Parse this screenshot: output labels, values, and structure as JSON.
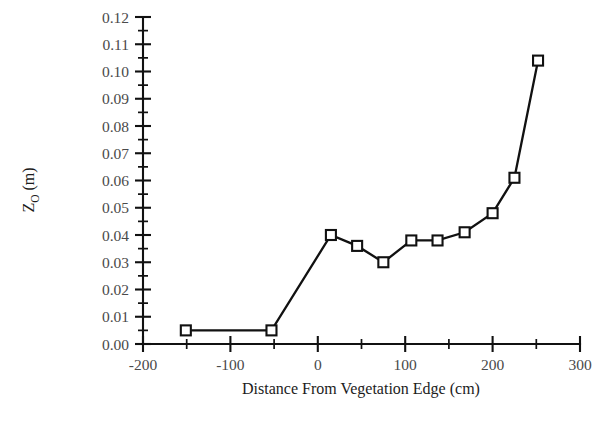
{
  "chart_data": {
    "type": "line",
    "title": "",
    "xlabel": "Distance From Vegetation Edge (cm)",
    "ylabel": "Z_O (m)",
    "ylabel_base": "Z",
    "ylabel_sub": "O",
    "ylabel_unit": " (m)",
    "xlim": [
      -200,
      300
    ],
    "ylim": [
      0.0,
      0.12
    ],
    "x_major_ticks": [
      -200,
      -100,
      0,
      100,
      200,
      300
    ],
    "x_major_tick_labels": [
      "-200",
      "-100",
      "0",
      "100",
      "200",
      "300"
    ],
    "x_minor_tick_interval": 50,
    "y_major_ticks": [
      0.0,
      0.01,
      0.02,
      0.03,
      0.04,
      0.05,
      0.06,
      0.07,
      0.08,
      0.09,
      0.1,
      0.11,
      0.12
    ],
    "y_major_tick_labels": [
      "0.00",
      "0.01",
      "0.02",
      "0.03",
      "0.04",
      "0.05",
      "0.06",
      "0.07",
      "0.08",
      "0.09",
      "0.10",
      "0.11",
      "0.12"
    ],
    "y_minor_tick_interval": 0.005,
    "grid": false,
    "legend": false,
    "marker": "open-square",
    "line_color": "#111111",
    "marker_face_color": "#ffffff",
    "marker_edge_color": "#111111",
    "series": [
      {
        "name": "Z_O vs distance",
        "x": [
          -151,
          -53,
          15,
          45,
          75,
          107,
          137,
          168,
          200,
          225,
          252
        ],
        "y": [
          0.005,
          0.005,
          0.04,
          0.036,
          0.03,
          0.038,
          0.038,
          0.041,
          0.048,
          0.061,
          0.104
        ]
      }
    ]
  },
  "axes": {
    "x_axis_name": "x-axis",
    "y_axis_name": "y-axis"
  }
}
